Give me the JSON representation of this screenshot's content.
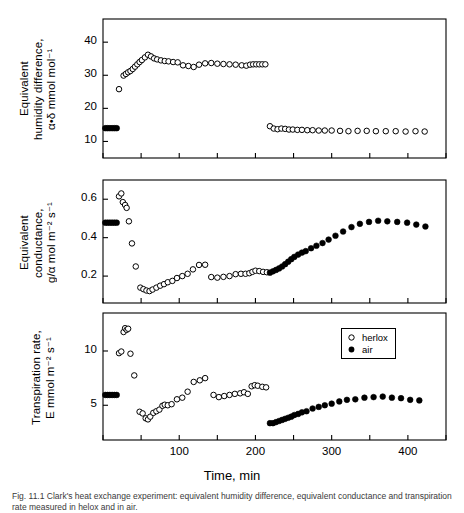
{
  "figure": {
    "xaxis_title": "Time,  min",
    "caption": "Fig. 11.1   Clark's heat exchange experiment: equivalent humidity difference, equivalent conductance and transpiration rate measured in helox and in air.",
    "legend": {
      "position": "bottom-panel-top-right",
      "entries": [
        {
          "label": "herlox",
          "marker": "open-circle"
        },
        {
          "label": "air",
          "marker": "filled-circle"
        }
      ]
    }
  },
  "chart_data": [
    {
      "panel": "top",
      "type": "scatter",
      "title": "",
      "xlabel": "Time, min",
      "ylabel": "Equivalent humidity difference, α·δ mmol mol⁻¹",
      "ylabel_lines": [
        "Equivalent",
        "humidity difference,",
        "α•δ  mmol  mol⁻¹"
      ],
      "xlim": [
        0,
        450
      ],
      "ylim": [
        5,
        47
      ],
      "xticks": [
        0,
        50,
        100,
        150,
        200,
        250,
        300,
        350,
        400,
        450
      ],
      "xticklabels": [
        "",
        "",
        "100",
        "",
        "200",
        "",
        "300",
        "",
        "400",
        ""
      ],
      "yticks": [
        10,
        20,
        30,
        40
      ],
      "yticklabels": [
        "10",
        "20",
        "30",
        "40"
      ],
      "grid": false,
      "series": [
        {
          "name": "air",
          "marker": "filled-circle",
          "points": [
            [
              3,
              14.0
            ],
            [
              6,
              14.0
            ],
            [
              9,
              14.0
            ],
            [
              12,
              14.0
            ],
            [
              15,
              14.0
            ],
            [
              18,
              14.0
            ]
          ]
        },
        {
          "name": "herlox",
          "marker": "open-circle",
          "points": [
            [
              21,
              25.8
            ],
            [
              27,
              29.9
            ],
            [
              30,
              30.4
            ],
            [
              33,
              30.9
            ],
            [
              36,
              31.3
            ],
            [
              39,
              31.9
            ],
            [
              42,
              32.6
            ],
            [
              45,
              33.3
            ],
            [
              48,
              34.0
            ],
            [
              51,
              34.6
            ],
            [
              55,
              35.4
            ],
            [
              59,
              36.2
            ],
            [
              63,
              35.7
            ],
            [
              67,
              35.1
            ],
            [
              71,
              34.8
            ],
            [
              76,
              34.5
            ],
            [
              81,
              34.3
            ],
            [
              86,
              34.2
            ],
            [
              92,
              34.0
            ],
            [
              98,
              33.9
            ],
            [
              105,
              33.0
            ],
            [
              112,
              32.8
            ],
            [
              119,
              32.5
            ],
            [
              126,
              33.2
            ],
            [
              134,
              33.6
            ],
            [
              142,
              33.7
            ],
            [
              150,
              33.5
            ],
            [
              158,
              33.4
            ],
            [
              166,
              33.3
            ],
            [
              174,
              33.2
            ],
            [
              182,
              33.0
            ],
            [
              188,
              32.9
            ],
            [
              193,
              33.2
            ],
            [
              197,
              33.3
            ],
            [
              201,
              33.3
            ],
            [
              205,
              33.3
            ],
            [
              209,
              33.3
            ],
            [
              213,
              33.3
            ]
          ]
        },
        {
          "name": "herlox-air-phase",
          "marker": "open-circle",
          "points": [
            [
              219,
              14.6
            ],
            [
              224,
              13.9
            ],
            [
              229,
              13.7
            ],
            [
              234,
              13.9
            ],
            [
              239,
              13.8
            ],
            [
              244,
              13.6
            ],
            [
              249,
              13.6
            ],
            [
              255,
              13.5
            ],
            [
              261,
              13.5
            ],
            [
              268,
              13.4
            ],
            [
              275,
              13.4
            ],
            [
              283,
              13.3
            ],
            [
              291,
              13.3
            ],
            [
              300,
              13.3
            ],
            [
              311,
              13.2
            ],
            [
              322,
              13.1
            ],
            [
              334,
              13.2
            ],
            [
              346,
              13.2
            ],
            [
              358,
              13.1
            ],
            [
              371,
              13.1
            ],
            [
              384,
              13.1
            ],
            [
              397,
              13.0
            ],
            [
              410,
              13.1
            ],
            [
              422,
              13.0
            ]
          ]
        }
      ]
    },
    {
      "panel": "middle",
      "type": "scatter",
      "title": "",
      "xlabel": "Time, min",
      "ylabel": "Equivalent conductance, g/α mol m⁻² s⁻¹",
      "ylabel_lines": [
        "Equivalent",
        "conductance,",
        "g/α  mol  m⁻² s⁻¹"
      ],
      "xlim": [
        0,
        450
      ],
      "ylim": [
        0.06,
        0.7
      ],
      "xticks": [
        0,
        50,
        100,
        150,
        200,
        250,
        300,
        350,
        400,
        450
      ],
      "xticklabels": [
        "",
        "",
        "100",
        "",
        "200",
        "",
        "300",
        "",
        "400",
        ""
      ],
      "yticks": [
        0.2,
        0.4,
        0.6
      ],
      "yticklabels": [
        "0.2",
        "0.4",
        "0.6"
      ],
      "grid": false,
      "series": [
        {
          "name": "air",
          "marker": "filled-circle",
          "points": [
            [
              3,
              0.478
            ],
            [
              6,
              0.478
            ],
            [
              9,
              0.478
            ],
            [
              12,
              0.478
            ],
            [
              15,
              0.478
            ],
            [
              18,
              0.478
            ]
          ]
        },
        {
          "name": "herlox",
          "marker": "open-circle",
          "points": [
            [
              21,
              0.615
            ],
            [
              24,
              0.63
            ],
            [
              26,
              0.585
            ],
            [
              29,
              0.57
            ],
            [
              31,
              0.555
            ],
            [
              34,
              0.485
            ],
            [
              38,
              0.37
            ],
            [
              43,
              0.25
            ],
            [
              49,
              0.14
            ],
            [
              53,
              0.132
            ],
            [
              57,
              0.125
            ],
            [
              61,
              0.122
            ],
            [
              65,
              0.13
            ],
            [
              70,
              0.14
            ],
            [
              75,
              0.15
            ],
            [
              80,
              0.158
            ],
            [
              85,
              0.168
            ],
            [
              91,
              0.175
            ],
            [
              97,
              0.19
            ],
            [
              104,
              0.2
            ],
            [
              111,
              0.212
            ],
            [
              118,
              0.235
            ],
            [
              126,
              0.258
            ],
            [
              134,
              0.259
            ],
            [
              142,
              0.195
            ],
            [
              150,
              0.192
            ],
            [
              158,
              0.196
            ],
            [
              166,
              0.2
            ],
            [
              174,
              0.21
            ],
            [
              181,
              0.212
            ],
            [
              187,
              0.212
            ],
            [
              192,
              0.215
            ],
            [
              196,
              0.222
            ],
            [
              200,
              0.228
            ],
            [
              205,
              0.226
            ],
            [
              210,
              0.222
            ],
            [
              215,
              0.22
            ]
          ]
        },
        {
          "name": "air-phase",
          "marker": "filled-circle",
          "points": [
            [
              219,
              0.218
            ],
            [
              223,
              0.225
            ],
            [
              227,
              0.232
            ],
            [
              231,
              0.24
            ],
            [
              235,
              0.25
            ],
            [
              239,
              0.262
            ],
            [
              243,
              0.275
            ],
            [
              247,
              0.288
            ],
            [
              251,
              0.3
            ],
            [
              256,
              0.312
            ],
            [
              261,
              0.322
            ],
            [
              266,
              0.33
            ],
            [
              273,
              0.345
            ],
            [
              280,
              0.358
            ],
            [
              288,
              0.372
            ],
            [
              296,
              0.39
            ],
            [
              305,
              0.41
            ],
            [
              315,
              0.432
            ],
            [
              326,
              0.455
            ],
            [
              337,
              0.472
            ],
            [
              349,
              0.482
            ],
            [
              361,
              0.488
            ],
            [
              373,
              0.485
            ],
            [
              386,
              0.482
            ],
            [
              399,
              0.478
            ],
            [
              411,
              0.468
            ],
            [
              423,
              0.458
            ]
          ]
        }
      ]
    },
    {
      "panel": "bottom",
      "type": "scatter",
      "title": "",
      "xlabel": "Time, min",
      "ylabel": "Transpiration rate, E mmol m⁻² s⁻¹",
      "ylabel_lines": [
        "Transpiration rate,",
        "E mmol  m⁻² s⁻¹"
      ],
      "xlim": [
        0,
        450
      ],
      "ylim": [
        1.8,
        13.5
      ],
      "xticks": [
        0,
        50,
        100,
        150,
        200,
        250,
        300,
        350,
        400,
        450
      ],
      "xticklabels": [
        "",
        "",
        "100",
        "",
        "200",
        "",
        "300",
        "",
        "400",
        ""
      ],
      "yticks": [
        5,
        10
      ],
      "yticklabels": [
        "5",
        "10"
      ],
      "grid": false,
      "series": [
        {
          "name": "air",
          "marker": "filled-circle",
          "points": [
            [
              3,
              5.95
            ],
            [
              6,
              5.95
            ],
            [
              9,
              5.95
            ],
            [
              12,
              5.95
            ],
            [
              15,
              5.95
            ],
            [
              18,
              5.95
            ]
          ]
        },
        {
          "name": "herlox",
          "marker": "open-circle",
          "points": [
            [
              21,
              9.8
            ],
            [
              24,
              9.95
            ],
            [
              27,
              11.75
            ],
            [
              29,
              12.1
            ],
            [
              31,
              11.95
            ],
            [
              33,
              12.05
            ],
            [
              36,
              9.75
            ],
            [
              41,
              7.75
            ],
            [
              48,
              4.4
            ],
            [
              52,
              4.25
            ],
            [
              56,
              3.8
            ],
            [
              59,
              3.7
            ],
            [
              62,
              3.95
            ],
            [
              66,
              4.3
            ],
            [
              70,
              4.45
            ],
            [
              74,
              4.6
            ],
            [
              78,
              4.95
            ],
            [
              81,
              5.05
            ],
            [
              85,
              5.0
            ],
            [
              90,
              5.1
            ],
            [
              97,
              5.55
            ],
            [
              104,
              5.7
            ],
            [
              111,
              6.25
            ],
            [
              119,
              7.15
            ],
            [
              127,
              7.3
            ],
            [
              134,
              7.5
            ],
            [
              145,
              5.95
            ],
            [
              152,
              5.75
            ],
            [
              159,
              5.85
            ],
            [
              166,
              5.95
            ],
            [
              173,
              6.05
            ],
            [
              180,
              6.1
            ],
            [
              185,
              6.2
            ],
            [
              190,
              6.05
            ],
            [
              195,
              6.75
            ],
            [
              199,
              6.85
            ],
            [
              203,
              6.8
            ],
            [
              209,
              6.7
            ],
            [
              214,
              6.65
            ]
          ]
        },
        {
          "name": "air-phase",
          "marker": "filled-circle",
          "points": [
            [
              219,
              3.35
            ],
            [
              223,
              3.35
            ],
            [
              227,
              3.45
            ],
            [
              231,
              3.55
            ],
            [
              235,
              3.65
            ],
            [
              239,
              3.75
            ],
            [
              243,
              3.85
            ],
            [
              247,
              3.95
            ],
            [
              251,
              4.1
            ],
            [
              256,
              4.2
            ],
            [
              261,
              4.35
            ],
            [
              267,
              4.45
            ],
            [
              275,
              4.7
            ],
            [
              283,
              4.85
            ],
            [
              291,
              5.0
            ],
            [
              300,
              5.15
            ],
            [
              310,
              5.35
            ],
            [
              320,
              5.5
            ],
            [
              331,
              5.55
            ],
            [
              343,
              5.7
            ],
            [
              355,
              5.75
            ],
            [
              367,
              5.8
            ],
            [
              379,
              5.7
            ],
            [
              391,
              5.65
            ],
            [
              403,
              5.5
            ],
            [
              415,
              5.45
            ]
          ]
        }
      ]
    }
  ]
}
